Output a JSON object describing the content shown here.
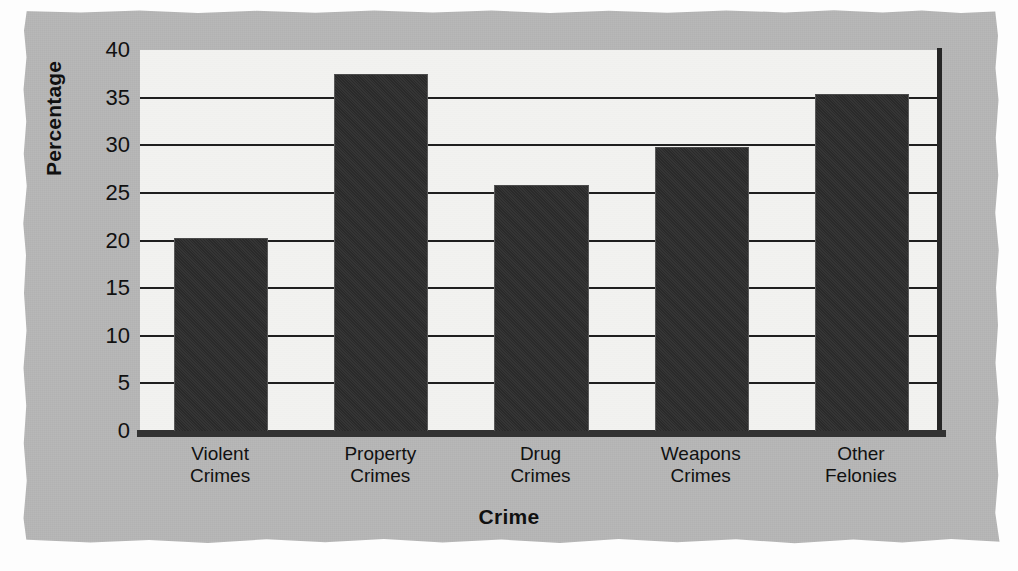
{
  "chart_data": {
    "type": "bar",
    "title": "",
    "xlabel": "Crime",
    "ylabel": "Percentage",
    "categories": [
      "Violent Crimes",
      "Property Crimes",
      "Drug Crimes",
      "Weapons Crimes",
      "Other Felonies"
    ],
    "category_lines": [
      [
        "Violent",
        "Crimes"
      ],
      [
        "Property",
        "Crimes"
      ],
      [
        "Drug",
        "Crimes"
      ],
      [
        "Weapons",
        "Crimes"
      ],
      [
        "Other",
        "Felonies"
      ]
    ],
    "values": [
      20.2,
      37.4,
      25.7,
      29.7,
      35.3
    ],
    "ylim": [
      0,
      40
    ],
    "ytick_values": [
      40,
      35,
      30,
      25,
      20,
      15,
      10,
      5,
      0
    ],
    "ytick_labels": [
      "40",
      "35",
      "30",
      "25",
      "20",
      "15",
      "10",
      "5",
      "0"
    ],
    "grid": "horizontal",
    "legend": "none",
    "bar_color": "#2c2c2c",
    "plot_background": "#f2f2f0",
    "figure_background": "#b6b6b6",
    "axis_color": "#1f1f1f"
  }
}
